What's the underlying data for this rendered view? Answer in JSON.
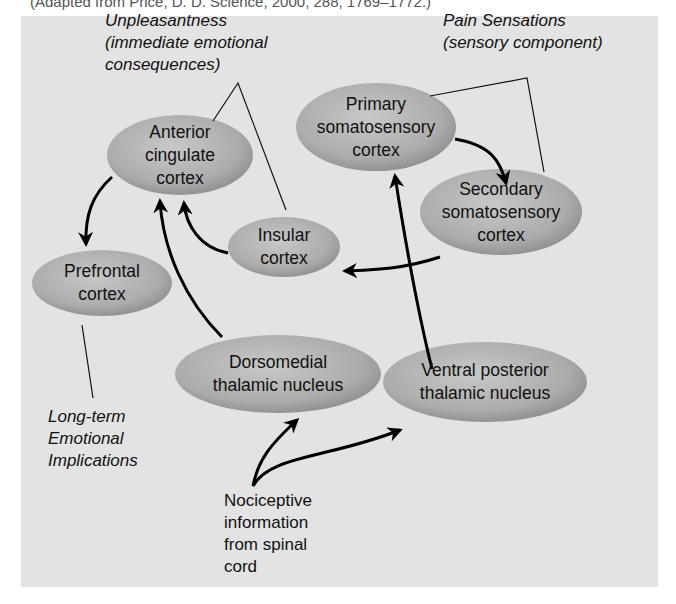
{
  "caption": "(Adapted from Price, D. D. Science, 2000, 288, 1769–1772.)",
  "annotations": {
    "unpleasantness": [
      "Unpleasantness",
      "(immediate emotional",
      "consequences)"
    ],
    "pain_sensations": [
      "Pain Sensations",
      "(sensory component)"
    ],
    "long_term": [
      "Long-term",
      "Emotional",
      "Implications"
    ],
    "nociceptive": [
      "Nociceptive",
      "information",
      "from spinal",
      "cord"
    ]
  },
  "nodes": {
    "anterior_cingulate": [
      "Anterior",
      "cingulate",
      "cortex"
    ],
    "primary_somatosensory": [
      "Primary",
      "somatosensory",
      "cortex"
    ],
    "secondary_somatosensory": [
      "Secondary",
      "somatosensory",
      "cortex"
    ],
    "insular": [
      "Insular",
      "cortex"
    ],
    "prefrontal": [
      "Prefrontal",
      "cortex"
    ],
    "dorsomedial": [
      "Dorsomedial",
      "thalamic nucleus"
    ],
    "ventral_posterior": [
      "Ventral posterior",
      "thalamic nucleus"
    ]
  },
  "colors": {
    "panel": "#e3e3e3",
    "node_light": "#c4c4c4",
    "node_dark": "#8e8e8e",
    "arrow": "#000000"
  }
}
